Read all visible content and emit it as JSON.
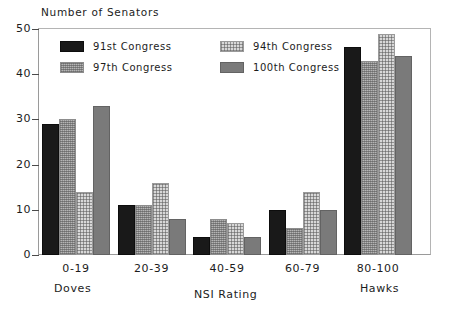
{
  "chart_data": {
    "type": "bar",
    "title": "",
    "ylabel": "Number of Senators",
    "xlabel": "NSI Rating",
    "categories": [
      "0-19",
      "20-39",
      "40-59",
      "60-79",
      "80-100"
    ],
    "axis_end_labels": {
      "left": "Doves",
      "right": "Hawks"
    },
    "ylim": [
      0,
      50
    ],
    "yticks": [
      0,
      10,
      20,
      30,
      40,
      50
    ],
    "ytick_labels": [
      "0",
      "10",
      "20",
      "30",
      "40",
      "50"
    ],
    "grid": false,
    "legend_position": "upper-left-inside",
    "series": [
      {
        "name": "91st Congress",
        "pattern": "solid-black",
        "color": "#191919",
        "values": [
          29,
          11,
          4,
          10,
          46
        ]
      },
      {
        "name": "97th Congress",
        "pattern": "dense-hatch",
        "color": "#b5b5b5",
        "values": [
          30,
          11,
          8,
          6,
          43
        ]
      },
      {
        "name": "94th Congress",
        "pattern": "light-crosshatch",
        "color": "#d8d8d8",
        "values": [
          14,
          16,
          7,
          14,
          49
        ]
      },
      {
        "name": "100th Congress",
        "pattern": "solid-gray",
        "color": "#7a7a7a",
        "values": [
          33,
          8,
          4,
          10,
          44
        ]
      }
    ],
    "legend_order": [
      "91st Congress",
      "94th Congress",
      "97th Congress",
      "100th Congress"
    ]
  }
}
